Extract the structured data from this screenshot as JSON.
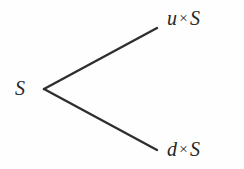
{
  "diagram": {
    "type": "binomial-tree",
    "background_color": "#fefefe",
    "line_color": "#2e2e2e",
    "text_color": "#262626",
    "nodes": {
      "root": {
        "label": "S",
        "variable": "S",
        "x": 44,
        "y": 89
      },
      "up": {
        "coefficient": "u",
        "operator": "×",
        "variable": "S",
        "label": "u × S",
        "x": 157,
        "y": 28
      },
      "down": {
        "coefficient": "d",
        "operator": "×",
        "variable": "S",
        "label": "d × S",
        "x": 157,
        "y": 150
      }
    },
    "edges": [
      {
        "name": "up-branch",
        "from": "root",
        "to": "up",
        "x1": 44,
        "y1": 89,
        "x2": 157,
        "y2": 28
      },
      {
        "name": "down-branch",
        "from": "root",
        "to": "down",
        "x1": 44,
        "y1": 89,
        "x2": 157,
        "y2": 150
      }
    ]
  }
}
